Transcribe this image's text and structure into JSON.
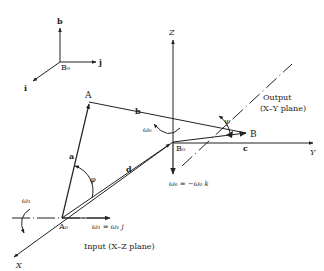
{
  "frame": {
    "origin": "B₀",
    "axes": {
      "up": "b",
      "right": "j",
      "down_left": "i"
    }
  },
  "axes": {
    "z": "Z",
    "y": "Y",
    "x": "X"
  },
  "points": {
    "A": "A",
    "A0": "A₀",
    "B": "B",
    "B0": "B₀"
  },
  "links": {
    "a": "a",
    "b": "b",
    "c": "c",
    "d": "d"
  },
  "angles": {
    "phi": "φ",
    "psi": "ψ"
  },
  "angular_velocities": {
    "input": "ω₁",
    "input_vector": "ω₁ = ω₁ j",
    "output": "ω₀",
    "output_vector": "ω₀ = −ω₀ k"
  },
  "planes": {
    "output_title": "Output",
    "output_plane": "(X–Y plane)",
    "input": "Input (X–Z plane)"
  }
}
